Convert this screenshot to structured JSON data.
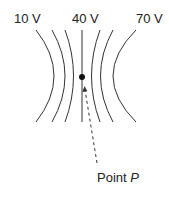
{
  "diagram": {
    "potential_labels": [
      {
        "text": "10 V",
        "x": 14,
        "y": 12
      },
      {
        "text": "40 V",
        "x": 72,
        "y": 12
      },
      {
        "text": "70 V",
        "x": 136,
        "y": 12
      }
    ],
    "point_label": {
      "prefix": "Point ",
      "name": "P"
    },
    "line_color": "#333333",
    "dot_color": "#111111"
  }
}
